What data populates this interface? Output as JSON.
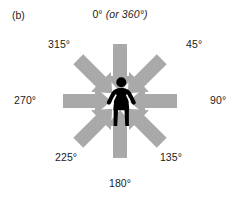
{
  "figure": {
    "panel_label": "(b)",
    "background_color": "#ffffff",
    "arrow_color": "#a9a9a9",
    "figure_color": "#000000",
    "text_color": "#1c1c1c",
    "center_icon": "standing-person-silhouette-icon"
  },
  "labels": {
    "top": {
      "main": "0°",
      "alt": "(or 360°)",
      "angle": 0,
      "direction": "down"
    },
    "upper_right": {
      "main": "45°",
      "angle": 45,
      "direction": "down-left"
    },
    "right": {
      "main": "90°",
      "angle": 90,
      "direction": "left"
    },
    "lower_right": {
      "main": "135°",
      "angle": 135,
      "direction": "up-left"
    },
    "bottom": {
      "main": "180°",
      "angle": 180,
      "direction": "up"
    },
    "lower_left": {
      "main": "225°",
      "angle": 225,
      "direction": "up-right"
    },
    "left": {
      "main": "270°",
      "angle": 270,
      "direction": "right"
    },
    "upper_left": {
      "main": "315°",
      "angle": 315,
      "direction": "down-right"
    }
  }
}
